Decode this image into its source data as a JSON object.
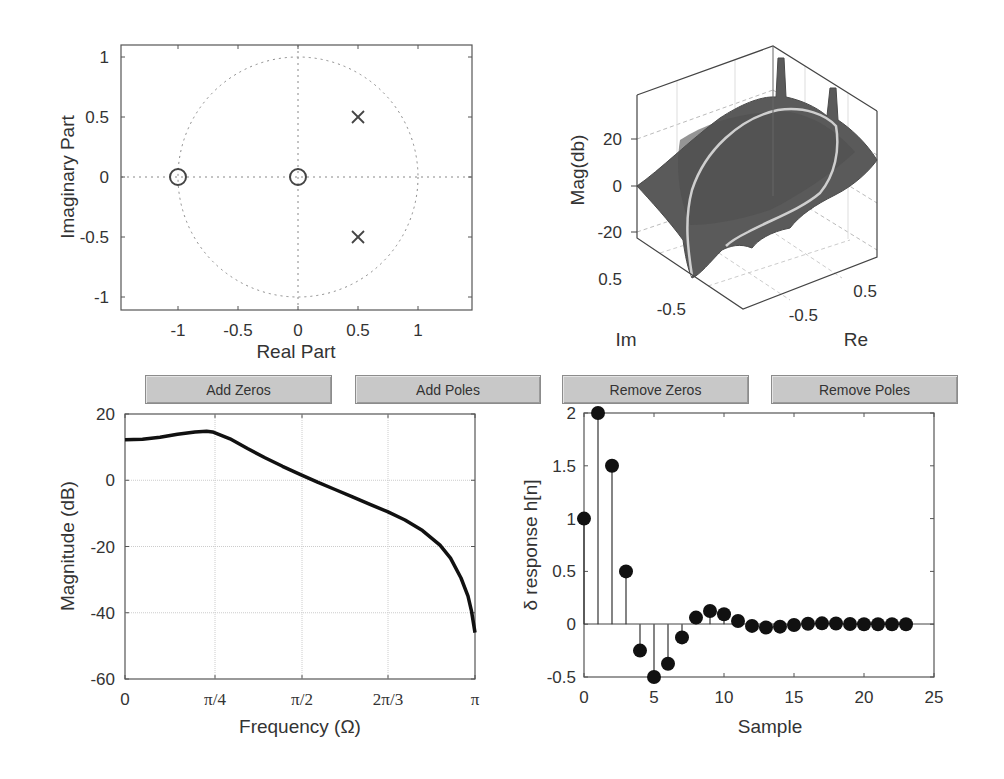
{
  "buttons": {
    "add_zeros": "Add Zeros",
    "add_poles": "Add Poles",
    "remove_zeros": "Remove Zeros",
    "remove_poles": "Remove Poles"
  },
  "colors": {
    "axis": "#555555",
    "grid": "#bbbbbb",
    "curve": "#111111",
    "surface": "#5a5a5a",
    "unit_circle_trace": "#c8c8c8",
    "button_bg": "#c8c8c8"
  },
  "chart_data": [
    {
      "id": "pole-zero",
      "type": "scatter",
      "title": "",
      "xlabel": "Real Part",
      "ylabel": "Imaginary Part",
      "xlim": [
        -1.475,
        1.45
      ],
      "ylim": [
        -1.1,
        1.1
      ],
      "xticks": [
        "-1",
        "-0.5",
        "0",
        "0.5",
        "1"
      ],
      "yticks": [
        "1",
        "0.5",
        "0",
        "-0.5",
        "-1"
      ],
      "unit_circle": true,
      "zeros": [
        {
          "re": -1,
          "im": 0
        },
        {
          "re": 0,
          "im": 0
        }
      ],
      "poles": [
        {
          "re": 0.5,
          "im": 0.5
        },
        {
          "re": 0.5,
          "im": -0.5
        }
      ],
      "legend": null
    },
    {
      "id": "magnitude-surface",
      "type": "surface3d",
      "xlabel": "Re",
      "ylabel": "Im",
      "zlabel": "Mag(db)",
      "zticks": [
        "20",
        "0",
        "-20"
      ],
      "xticks": [
        "-0.5",
        "0.5"
      ],
      "yticks": [
        "0.5",
        "-0.5"
      ],
      "note": "|H(z)| in dB over z-plane with unit-circle trace highlighted"
    },
    {
      "id": "frequency-response",
      "type": "line",
      "xlabel": "Frequency (Ω)",
      "ylabel": "Magnitude (dB)",
      "xticks": [
        "0",
        "π/4",
        "π/2",
        "2π/3",
        "π"
      ],
      "yticks": [
        "20",
        "0",
        "-20",
        "-40",
        "-60"
      ],
      "ylim": [
        -60,
        20
      ],
      "grid": true,
      "x_fraction_of_pi": [
        0,
        0.05,
        0.1,
        0.15,
        0.2,
        0.233,
        0.25,
        0.3,
        0.35,
        0.4,
        0.45,
        0.5,
        0.55,
        0.6,
        0.65,
        0.7,
        0.75,
        0.8,
        0.85,
        0.9,
        0.93,
        0.96,
        0.98,
        0.99,
        1.0
      ],
      "values": [
        12.2,
        12.4,
        13.0,
        13.9,
        14.6,
        14.8,
        14.6,
        12.5,
        9.6,
        6.8,
        4.2,
        1.8,
        -0.6,
        -2.8,
        -5.0,
        -7.3,
        -9.5,
        -12.0,
        -15.2,
        -19.6,
        -23.5,
        -29.5,
        -35.0,
        -39.5,
        -46.0
      ]
    },
    {
      "id": "impulse-response",
      "type": "stem",
      "xlabel": "Sample",
      "ylabel": "δ response h[n]",
      "xlim": [
        0,
        25
      ],
      "ylim": [
        -0.5,
        2
      ],
      "xticks": [
        "0",
        "5",
        "10",
        "15",
        "20",
        "25"
      ],
      "yticks": [
        "2",
        "1.5",
        "1",
        "0.5",
        "0",
        "-0.5"
      ],
      "n": [
        0,
        1,
        2,
        3,
        4,
        5,
        6,
        7,
        8,
        9,
        10,
        11,
        12,
        13,
        14,
        15,
        16,
        17,
        18,
        19,
        20,
        21,
        22,
        23
      ],
      "values": [
        1.0,
        2.0,
        1.5,
        0.5,
        -0.25,
        -0.5,
        -0.375,
        -0.125,
        0.0625,
        0.125,
        0.094,
        0.031,
        -0.016,
        -0.031,
        -0.023,
        -0.008,
        0.004,
        0.008,
        0.006,
        0.002,
        0.0,
        0.0,
        0.0,
        0.0
      ]
    }
  ]
}
